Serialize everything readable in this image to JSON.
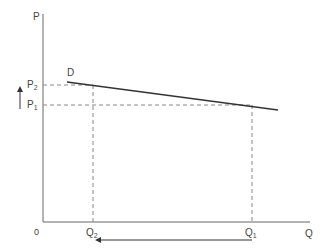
{
  "diagram": {
    "type": "supply-demand",
    "axes": {
      "y_label": "P",
      "x_label": "Q",
      "origin_label": "0"
    },
    "curve": {
      "label": "D",
      "from": [
        67,
        82
      ],
      "to": [
        278,
        110
      ]
    },
    "price_levels": [
      {
        "label": "P",
        "sub": "2",
        "y": 85
      },
      {
        "label": "P",
        "sub": "1",
        "y": 105
      }
    ],
    "quantity_levels": [
      {
        "label": "Q",
        "sub": "2",
        "x": 93
      },
      {
        "label": "Q",
        "sub": "1",
        "x": 252
      }
    ],
    "arrows": [
      {
        "name": "price-increase",
        "direction": "up"
      },
      {
        "name": "quantity-decrease",
        "direction": "left"
      }
    ],
    "colors": {
      "axis": "#666666",
      "curve": "#333333",
      "dashed": "#888888"
    }
  }
}
